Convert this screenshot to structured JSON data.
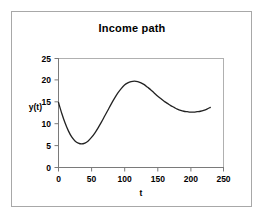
{
  "chart_data": {
    "type": "line",
    "title": "Income path",
    "xlabel": "t",
    "ylabel": "y(t)",
    "xlim": [
      0,
      250
    ],
    "ylim": [
      0,
      25
    ],
    "xticks": [
      0,
      50,
      100,
      150,
      200,
      250
    ],
    "yticks": [
      0,
      5,
      10,
      15,
      20,
      25
    ],
    "xtick_labels": [
      "0",
      "50",
      "100",
      "150",
      "200",
      "250"
    ],
    "ytick_labels": [
      "0",
      "5",
      "10",
      "15",
      "20",
      "25"
    ],
    "grid": false,
    "legend": null,
    "series": [
      {
        "name": "y(t)",
        "color": "#222222",
        "x": [
          0,
          5,
          10,
          15,
          20,
          25,
          30,
          35,
          40,
          45,
          50,
          55,
          60,
          65,
          70,
          75,
          80,
          85,
          90,
          95,
          100,
          105,
          110,
          115,
          120,
          125,
          130,
          135,
          140,
          145,
          150,
          155,
          160,
          165,
          170,
          175,
          180,
          185,
          190,
          195,
          200,
          205,
          210,
          215,
          220,
          225,
          230
        ],
        "y": [
          14.9,
          12.4,
          10.2,
          8.4,
          7.0,
          6.1,
          5.6,
          5.4,
          5.6,
          6.1,
          6.9,
          7.9,
          9.1,
          10.4,
          11.8,
          13.2,
          14.6,
          15.9,
          17.1,
          18.1,
          18.9,
          19.4,
          19.7,
          19.8,
          19.7,
          19.4,
          19.0,
          18.4,
          17.8,
          17.1,
          16.4,
          15.8,
          15.2,
          14.7,
          14.2,
          13.8,
          13.4,
          13.1,
          12.9,
          12.8,
          12.7,
          12.7,
          12.8,
          12.9,
          13.1,
          13.4,
          13.8
        ]
      }
    ]
  },
  "axes_marks": {
    "x_axis_end_tick": "250",
    "y_axis_top_tick": "25"
  }
}
